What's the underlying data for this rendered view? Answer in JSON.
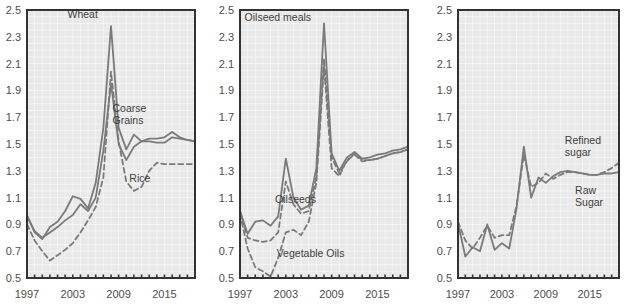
{
  "figure": {
    "background_color": "#ffffff",
    "plot_background_color": "#e9e9e9",
    "gridline_color": "#ffffff",
    "axis_color": "#333333",
    "line_color": "#7a7a7a",
    "text_color": "#4d4d4d"
  },
  "axis": {
    "ylim": [
      0.5,
      2.5
    ],
    "yticks": [
      "2.5",
      "2.3",
      "2.1",
      "1.9",
      "1.7",
      "1.5",
      "1.3",
      "1.1",
      "0.9",
      "0.7",
      "0.5"
    ],
    "ytick_values": [
      2.5,
      2.3,
      2.1,
      1.9,
      1.7,
      1.5,
      1.3,
      1.1,
      0.9,
      0.7,
      0.5
    ],
    "xlim": [
      1997,
      2019
    ],
    "xticks": [
      "1997",
      "2003",
      "2009",
      "2015"
    ],
    "xtick_values": [
      1997,
      2003,
      2009,
      2015
    ],
    "grid": true,
    "legend_position": "inline-annotations"
  },
  "chart_data": [
    {
      "type": "line",
      "title": "",
      "xlabel": "",
      "ylabel": "",
      "xlim": [
        1997,
        2019
      ],
      "ylim": [
        0.5,
        2.5
      ],
      "x": [
        1997,
        1998,
        1999,
        2000,
        2001,
        2002,
        2003,
        2004,
        2005,
        2006,
        2007,
        2008,
        2009,
        2010,
        2011,
        2012,
        2013,
        2014,
        2015,
        2016,
        2017,
        2018,
        2019
      ],
      "series": [
        {
          "name": "Wheat",
          "style": "solid",
          "label": "Wheat",
          "label_x": 2002.3,
          "label_y": 2.44,
          "values": [
            0.97,
            0.84,
            0.79,
            0.88,
            0.92,
            1.0,
            1.11,
            1.09,
            1.02,
            1.21,
            1.62,
            2.38,
            1.62,
            1.46,
            1.57,
            1.52,
            1.54,
            1.54,
            1.55,
            1.59,
            1.55,
            1.53,
            1.52
          ]
        },
        {
          "name": "Coarse Grains",
          "style": "solid",
          "label": "Coarse\nGrains",
          "label_x": 2008.2,
          "label_y": 1.74,
          "values": [
            0.96,
            0.85,
            0.8,
            0.84,
            0.88,
            0.93,
            0.97,
            1.05,
            1.0,
            1.1,
            1.45,
            1.95,
            1.5,
            1.38,
            1.48,
            1.52,
            1.52,
            1.51,
            1.51,
            1.55,
            1.54,
            1.53,
            1.52
          ]
        },
        {
          "name": "Rice",
          "style": "dashed",
          "label": "Rice",
          "label_x": 2010.4,
          "label_y": 1.22,
          "values": [
            0.9,
            0.78,
            0.7,
            0.63,
            0.67,
            0.71,
            0.76,
            0.84,
            0.93,
            1.03,
            1.25,
            2.04,
            1.52,
            1.22,
            1.15,
            1.18,
            1.3,
            1.36,
            1.35,
            1.35,
            1.35,
            1.35,
            1.35
          ]
        }
      ]
    },
    {
      "type": "line",
      "title": "",
      "xlabel": "",
      "ylabel": "",
      "xlim": [
        1997,
        2019
      ],
      "ylim": [
        0.5,
        2.5
      ],
      "x": [
        1997,
        1998,
        1999,
        2000,
        2001,
        2002,
        2003,
        2004,
        2005,
        2006,
        2007,
        2008,
        2009,
        2010,
        2011,
        2012,
        2013,
        2014,
        2015,
        2016,
        2017,
        2018,
        2019
      ],
      "series": [
        {
          "name": "Oilseed meals",
          "style": "solid",
          "label": "Oilseed meals",
          "label_x": 1997.6,
          "label_y": 2.42,
          "values": [
            1.0,
            0.83,
            0.92,
            0.93,
            0.89,
            0.96,
            1.39,
            1.1,
            1.01,
            1.04,
            1.32,
            2.4,
            1.43,
            1.3,
            1.4,
            1.44,
            1.39,
            1.4,
            1.42,
            1.43,
            1.45,
            1.46,
            1.48
          ]
        },
        {
          "name": "Oilseeds",
          "style": "dashed",
          "label": "Oilseeds",
          "label_x": 2001.6,
          "label_y": 1.06,
          "values": [
            1.0,
            0.8,
            0.78,
            0.77,
            0.78,
            0.84,
            1.22,
            1.05,
            0.98,
            1.0,
            1.26,
            2.14,
            1.4,
            1.28,
            1.37,
            1.43,
            1.38,
            1.38,
            1.39,
            1.41,
            1.43,
            1.44,
            1.46
          ]
        },
        {
          "name": "Vegetable Oils",
          "style": "dashed",
          "label": "Vegetable Oils",
          "label_x": 2001.8,
          "label_y": 0.66,
          "values": [
            0.98,
            0.72,
            0.58,
            0.55,
            0.51,
            0.65,
            0.84,
            0.86,
            0.82,
            0.92,
            1.21,
            2.08,
            1.32,
            1.26,
            1.38,
            1.42,
            1.37,
            1.38,
            1.39,
            1.41,
            1.43,
            1.44,
            1.46
          ]
        }
      ]
    },
    {
      "type": "line",
      "title": "",
      "xlabel": "",
      "ylabel": "",
      "xlim": [
        1997,
        2019
      ],
      "ylim": [
        0.5,
        2.5
      ],
      "x": [
        1997,
        1998,
        1999,
        2000,
        2001,
        2002,
        2003,
        2004,
        2005,
        2006,
        2007,
        2008,
        2009,
        2010,
        2011,
        2012,
        2013,
        2014,
        2015,
        2016,
        2017,
        2018,
        2019
      ],
      "series": [
        {
          "name": "Refined sugar",
          "style": "dashed",
          "label": "Refined\nsugar",
          "label_x": 2011.6,
          "label_y": 1.5,
          "values": [
            0.92,
            0.78,
            0.72,
            0.8,
            0.89,
            0.8,
            0.82,
            0.82,
            1.04,
            1.42,
            1.18,
            1.21,
            1.28,
            1.24,
            1.27,
            1.29,
            1.29,
            1.28,
            1.27,
            1.27,
            1.29,
            1.32,
            1.36
          ]
        },
        {
          "name": "Raw Sugar",
          "style": "solid",
          "label": "Raw\nSugar",
          "label_x": 2013.0,
          "label_y": 1.13,
          "values": [
            0.91,
            0.66,
            0.73,
            0.7,
            0.9,
            0.71,
            0.76,
            0.72,
            1.02,
            1.48,
            1.1,
            1.25,
            1.21,
            1.26,
            1.29,
            1.3,
            1.29,
            1.28,
            1.27,
            1.27,
            1.28,
            1.28,
            1.29
          ]
        }
      ]
    }
  ]
}
